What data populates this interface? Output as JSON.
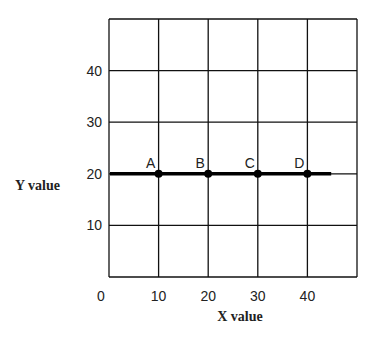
{
  "chart_data": {
    "type": "line",
    "title": "",
    "xlabel": "X value",
    "ylabel": "Y value",
    "xlim": [
      0,
      50
    ],
    "ylim": [
      0,
      50
    ],
    "x_ticks": [
      0,
      10,
      20,
      30,
      40
    ],
    "y_ticks": [
      10,
      20,
      30,
      40
    ],
    "grid": true,
    "series": [
      {
        "name": "horizontal line y=20",
        "x": [
          0,
          45
        ],
        "y": [
          20,
          20
        ],
        "color": "#000000"
      }
    ],
    "points": [
      {
        "label": "A",
        "x": 10,
        "y": 20
      },
      {
        "label": "B",
        "x": 20,
        "y": 20
      },
      {
        "label": "C",
        "x": 30,
        "y": 20
      },
      {
        "label": "D",
        "x": 40,
        "y": 20
      }
    ]
  }
}
